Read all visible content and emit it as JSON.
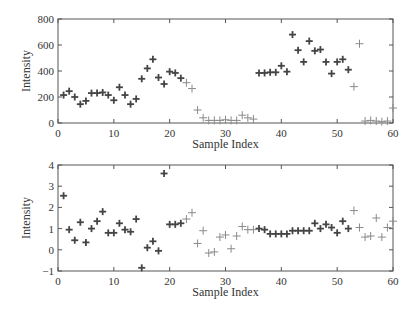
{
  "chart_data": [
    {
      "type": "scatter",
      "title": "",
      "xlabel": "Sample Index",
      "ylabel": "Intensity",
      "xlim": [
        0,
        60
      ],
      "ylim": [
        0,
        800
      ],
      "xticks": [
        0,
        10,
        20,
        30,
        40,
        50,
        60
      ],
      "yticks": [
        0,
        200,
        400,
        600,
        800
      ],
      "grid": false,
      "legend": null,
      "series": [
        {
          "name": "dark markers",
          "marker": "+",
          "color": "#444444",
          "x": [
            1,
            2,
            3,
            4,
            5,
            6,
            7,
            8,
            9,
            10,
            11,
            12,
            13,
            14,
            15,
            16,
            17,
            18,
            19,
            20,
            21,
            22,
            36,
            37,
            38,
            39,
            40,
            41,
            42,
            43,
            44,
            45,
            46,
            47,
            48,
            49,
            50,
            51,
            52
          ],
          "y": [
            215,
            245,
            200,
            145,
            170,
            230,
            230,
            235,
            215,
            175,
            275,
            215,
            145,
            185,
            340,
            420,
            490,
            350,
            300,
            395,
            385,
            345,
            385,
            385,
            390,
            390,
            440,
            395,
            680,
            560,
            470,
            630,
            555,
            565,
            470,
            380,
            470,
            490,
            410
          ]
        },
        {
          "name": "light markers",
          "marker": "+",
          "color": "#8a8a8a",
          "x": [
            23,
            24,
            25,
            26,
            27,
            28,
            29,
            30,
            31,
            32,
            33,
            34,
            35,
            53,
            54,
            55,
            56,
            57,
            58,
            59,
            60
          ],
          "y": [
            310,
            265,
            100,
            40,
            20,
            20,
            20,
            25,
            20,
            20,
            60,
            40,
            30,
            280,
            610,
            15,
            20,
            15,
            10,
            15,
            115
          ]
        }
      ]
    },
    {
      "type": "scatter",
      "title": "",
      "xlabel": "Sample Index",
      "ylabel": "Intensity",
      "xlim": [
        0,
        60
      ],
      "ylim": [
        -1,
        4
      ],
      "xticks": [
        0,
        10,
        20,
        30,
        40,
        50,
        60
      ],
      "yticks": [
        -1,
        0,
        1,
        2,
        3,
        4
      ],
      "grid": false,
      "legend": null,
      "series": [
        {
          "name": "dark markers",
          "marker": "+",
          "color": "#444444",
          "x": [
            1,
            2,
            3,
            4,
            5,
            6,
            7,
            8,
            9,
            10,
            11,
            12,
            13,
            14,
            15,
            16,
            17,
            18,
            19,
            20,
            21,
            22,
            36,
            37,
            38,
            39,
            40,
            41,
            42,
            43,
            44,
            45,
            46,
            47,
            48,
            49,
            50,
            51,
            52
          ],
          "y": [
            2.55,
            0.95,
            0.45,
            1.3,
            0.35,
            1.0,
            1.35,
            1.8,
            0.8,
            0.8,
            1.25,
            0.95,
            0.85,
            1.45,
            -0.85,
            0.1,
            0.4,
            -0.05,
            3.6,
            1.2,
            1.2,
            1.25,
            1.0,
            0.95,
            0.75,
            0.75,
            0.75,
            0.75,
            0.9,
            0.9,
            0.9,
            0.9,
            1.25,
            1.0,
            1.2,
            1.05,
            0.8,
            1.35,
            1.0
          ]
        },
        {
          "name": "light markers",
          "marker": "+",
          "color": "#8a8a8a",
          "x": [
            23,
            24,
            25,
            26,
            27,
            28,
            29,
            30,
            31,
            32,
            33,
            34,
            35,
            53,
            54,
            55,
            56,
            57,
            58,
            59,
            60
          ],
          "y": [
            1.45,
            1.75,
            0.3,
            0.9,
            -0.15,
            -0.1,
            0.6,
            0.7,
            0.05,
            0.65,
            1.1,
            0.95,
            0.95,
            1.85,
            1.05,
            0.6,
            0.65,
            1.5,
            0.6,
            1.05,
            1.35
          ]
        }
      ]
    }
  ],
  "layout": {
    "plots": [
      {
        "left": 58,
        "right": 393,
        "top": 19,
        "bottom": 123,
        "xlabel_y": 148,
        "ylabel_x": 30
      },
      {
        "left": 58,
        "right": 393,
        "top": 165,
        "bottom": 271,
        "xlabel_y": 296,
        "ylabel_x": 30
      }
    ]
  }
}
